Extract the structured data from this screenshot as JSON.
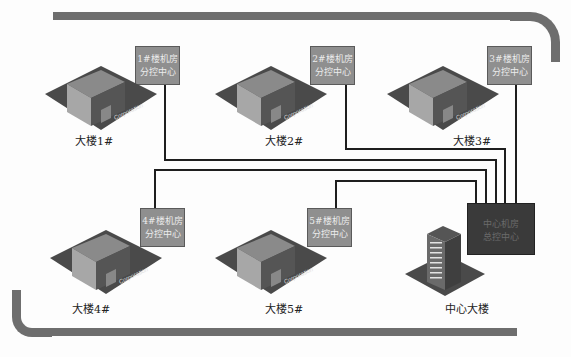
{
  "diagram": {
    "type": "network-topology",
    "colors": {
      "bus_bar": "#6e6e6e",
      "wire": "#1e1e1e",
      "control_box": "#8f8f8f",
      "center_box": "#3a3a3a"
    },
    "buildings": [
      {
        "id": "b1",
        "label": "大楼1#",
        "control_label_line1": "1#楼机房",
        "control_label_line2": "分控中心",
        "base_text": "Corporation"
      },
      {
        "id": "b2",
        "label": "大楼2#",
        "control_label_line1": "2#楼机房",
        "control_label_line2": "分控中心",
        "base_text": "Corporation"
      },
      {
        "id": "b3",
        "label": "大楼3#",
        "control_label_line1": "3#楼机房",
        "control_label_line2": "分控中心",
        "base_text": "Corporation"
      },
      {
        "id": "b4",
        "label": "大楼4#",
        "control_label_line1": "4#楼机房",
        "control_label_line2": "分控中心",
        "base_text": "Corporation"
      },
      {
        "id": "b5",
        "label": "大楼5#",
        "control_label_line1": "5#楼机房",
        "control_label_line2": "分控中心",
        "base_text": "Corporation"
      }
    ],
    "center": {
      "label": "中心大楼",
      "control_label_line1": "中心机房",
      "control_label_line2": "总控中心"
    },
    "connections": [
      "b1-center",
      "b2-center",
      "b3-center",
      "b4-center",
      "b5-center"
    ]
  }
}
